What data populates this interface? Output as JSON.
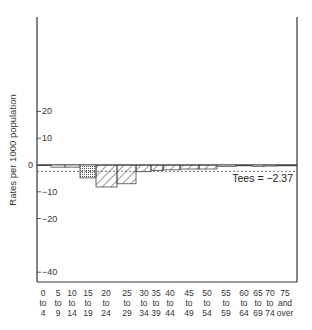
{
  "chart_data": {
    "type": "bar",
    "title": "",
    "xlabel": "",
    "ylabel": "Rates per 1000 population",
    "ylim": [
      -44,
      55
    ],
    "yticks": [
      20,
      10,
      0,
      -10,
      -20,
      -40
    ],
    "ytick_labels": [
      "20",
      "10",
      "0",
      "−10",
      "−20",
      "−40"
    ],
    "grid": false,
    "legend": null,
    "categories": [
      "0 to 4",
      "5 to 9",
      "10 to 14",
      "15 to 19",
      "20 to 24",
      "25 to 29",
      "30 to 34",
      "35 to 39",
      "40 to 44",
      "45 to 49",
      "50 to 54",
      "55 to 59",
      "60 to 64",
      "65 to 69",
      "70 to 74",
      "75 and over"
    ],
    "category_labels": [
      [
        "0",
        "to",
        "4"
      ],
      [
        "5",
        "to",
        "9"
      ],
      [
        "10",
        "to",
        "14"
      ],
      [
        "15",
        "to",
        "19"
      ],
      [
        "20",
        "to",
        "24"
      ],
      [
        "25",
        "to",
        "29"
      ],
      [
        "30",
        "to",
        "34"
      ],
      [
        "35",
        "to",
        "39"
      ],
      [
        "40",
        "to",
        "44"
      ],
      [
        "45",
        "to",
        "49"
      ],
      [
        "50",
        "to",
        "54"
      ],
      [
        "55",
        "to",
        "59"
      ],
      [
        "60",
        "to",
        "64"
      ],
      [
        "65",
        "to",
        "69"
      ],
      [
        "70",
        "to",
        "74"
      ],
      [
        "75",
        "and",
        "over"
      ]
    ],
    "values": [
      -0.1,
      -0.8,
      -0.8,
      -4.8,
      -8.2,
      -7.0,
      -2.5,
      -2.0,
      -1.8,
      -1.5,
      -1.5,
      -0.5,
      -0.3,
      -0.5,
      -0.4,
      -0.3
    ],
    "fills": [
      "none",
      "none",
      "none",
      "dots",
      "hatch",
      "hatch",
      "hatch",
      "hatch",
      "hatch",
      "hatch",
      "hatch",
      "none",
      "none",
      "none",
      "none",
      "none"
    ],
    "reference_line": {
      "value": -2.37,
      "style": "dashed"
    },
    "annotations": [
      {
        "text": "Tees = −2.37"
      }
    ]
  }
}
